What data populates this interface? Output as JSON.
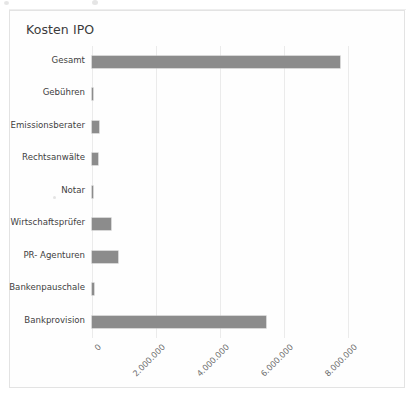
{
  "chart_data": {
    "type": "bar",
    "orientation": "horizontal",
    "title": "Kosten IPO",
    "xlabel": "",
    "ylabel": "",
    "categories": [
      "Gesamt",
      "Gebühren",
      "Emissionsberater",
      "Rechtsanwälte",
      "Notar",
      "Wirtschaftsprüfer",
      "PR- Agenturen",
      "Bankenpauschale",
      "Bankprovision"
    ],
    "values": [
      7750000,
      20000,
      215000,
      190000,
      15000,
      600000,
      820000,
      75000,
      5450000
    ],
    "xlim": [
      0,
      8000000
    ],
    "xticks": [
      0,
      2000000,
      4000000,
      6000000,
      8000000
    ],
    "xtick_labels": [
      "0",
      "2.000.000",
      "4.000.000",
      "6.000.000",
      "8.000.000"
    ],
    "grid": true,
    "legend": false,
    "bar_color": "#8c8c8c",
    "grid_color": "#ebebeb",
    "frame_color": "#e3e3e3"
  }
}
